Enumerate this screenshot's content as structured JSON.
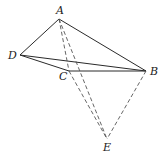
{
  "diagram": {
    "type": "geometry",
    "points": {
      "A": {
        "label": "A",
        "x": 59,
        "y": 19,
        "label_x": 56,
        "label_y": 14
      },
      "B": {
        "label": "B",
        "x": 146,
        "y": 71,
        "label_x": 150,
        "label_y": 75
      },
      "C": {
        "label": "C",
        "x": 69,
        "y": 71,
        "label_x": 59,
        "label_y": 80
      },
      "D": {
        "label": "D",
        "x": 20,
        "y": 55,
        "label_x": 8,
        "label_y": 59
      },
      "E": {
        "label": "E",
        "x": 107,
        "y": 139,
        "label_x": 103,
        "label_y": 151
      }
    },
    "solid_segments": [
      [
        "A",
        "D"
      ],
      [
        "A",
        "B"
      ],
      [
        "D",
        "C"
      ],
      [
        "D",
        "B"
      ],
      [
        "C",
        "B"
      ]
    ],
    "dashed_segments": [
      [
        "A",
        "C"
      ],
      [
        "C",
        "E"
      ],
      [
        "A",
        "E"
      ],
      [
        "B",
        "E"
      ]
    ],
    "colors": {
      "line": "#2a2a2a",
      "dashed": "#555555",
      "text": "#222222"
    }
  }
}
